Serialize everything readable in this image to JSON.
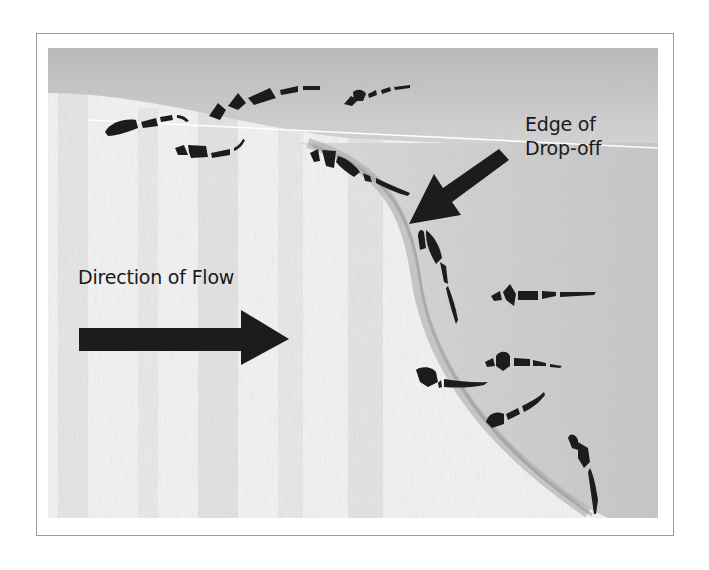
{
  "figure": {
    "labels": {
      "edge_line1": "Edge of",
      "edge_line2": "Drop-off",
      "flow": "Direction of Flow"
    },
    "arrows": [
      {
        "name": "flow-arrow",
        "direction": "right",
        "color": "#1c1c1c"
      },
      {
        "name": "drop-off-arrow",
        "direction": "down-left",
        "color": "#1c1c1c"
      }
    ],
    "colors": {
      "frame_border": "#9a9a9a",
      "water_light": "#f2f2f2",
      "water_shadow": "#bdbdbd",
      "ink": "#1c1c1c",
      "text": "#1a1a1a"
    },
    "fish_count": 11
  }
}
